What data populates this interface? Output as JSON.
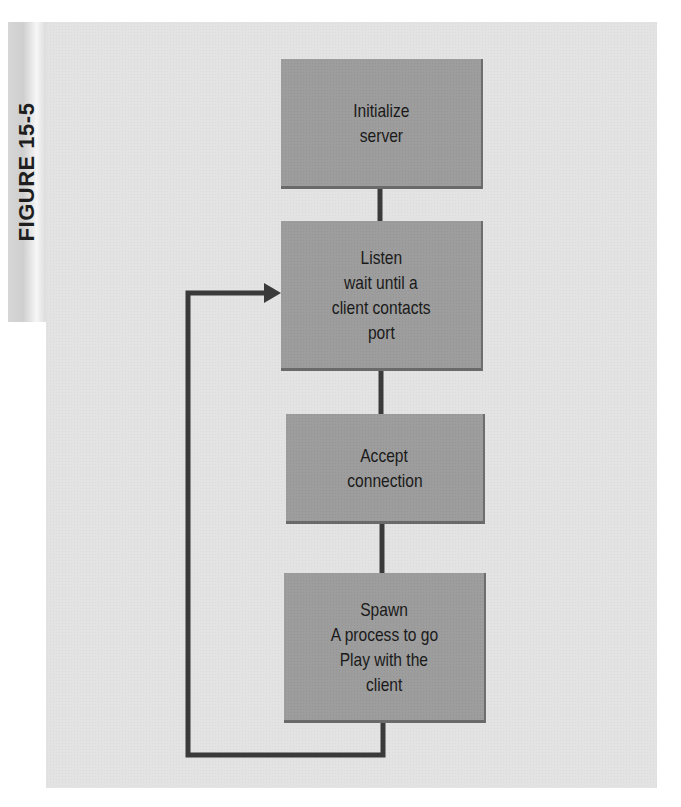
{
  "figure": {
    "label": "FIGURE 15-5"
  },
  "flowchart": {
    "steps": [
      {
        "id": "initialize",
        "lines": [
          "Initialize",
          "server"
        ]
      },
      {
        "id": "listen",
        "lines": [
          "Listen",
          "wait until a",
          "client contacts",
          "port"
        ]
      },
      {
        "id": "accept",
        "lines": [
          "Accept",
          "connection"
        ]
      },
      {
        "id": "spawn",
        "lines": [
          "Spawn",
          "A process to go",
          "Play with the",
          "client"
        ]
      }
    ],
    "connections": [
      {
        "from": "initialize",
        "to": "listen",
        "type": "line"
      },
      {
        "from": "listen",
        "to": "accept",
        "type": "line"
      },
      {
        "from": "accept",
        "to": "spawn",
        "type": "line"
      },
      {
        "from": "spawn",
        "to": "listen",
        "type": "loop-back-arrow"
      }
    ],
    "colors": {
      "box_fill": "#9d9d9d",
      "connector": "#3a3a3a",
      "panel": "#e3e3e3"
    }
  }
}
